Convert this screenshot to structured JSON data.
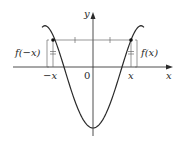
{
  "diagram": {
    "axes": {
      "x_label": "x",
      "y_label": "y",
      "origin_label": "0"
    },
    "points": {
      "left_x_label": "−x",
      "right_x_label": "x"
    },
    "brackets": {
      "left_label": "f(−x)",
      "right_label": "f(x)"
    },
    "colors": {
      "curve": "#2a2a2a",
      "axis": "#3a3a3a",
      "guide": "#6a6a6a",
      "background": "#ffffff"
    }
  }
}
